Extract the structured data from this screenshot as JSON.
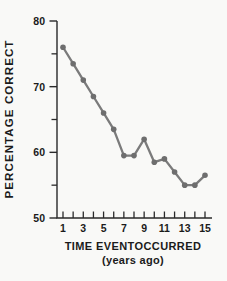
{
  "chart_data": {
    "type": "line",
    "title": "",
    "xlabel": "TIME EVENTOCCURRED",
    "xlabel_sub": "(years ago)",
    "ylabel": "PERCENTAGE CORRECT",
    "x": [
      1,
      2,
      3,
      4,
      5,
      6,
      7,
      8,
      9,
      10,
      11,
      12,
      13,
      14,
      15
    ],
    "values": [
      76,
      73.5,
      71,
      68.5,
      66,
      63.5,
      59.5,
      59.5,
      62,
      58.5,
      59,
      57,
      55,
      55,
      56.5
    ],
    "xlim": [
      1,
      15
    ],
    "ylim": [
      50,
      80
    ],
    "x_minor_ticks": [
      1,
      2,
      3,
      4,
      5,
      6,
      7,
      8,
      9,
      10,
      11,
      12,
      13,
      14,
      15
    ],
    "x_label_ticks": [
      1,
      3,
      5,
      7,
      9,
      11,
      13,
      15
    ],
    "y_major_ticks": [
      50,
      60,
      70,
      80
    ],
    "y_minor_ticks": [
      55,
      65,
      75
    ],
    "grid": false,
    "legend": null,
    "colors": {
      "line": "#7b7b7b",
      "marker": "#6e6e6e",
      "axis": "#2a2a2a",
      "text": "#1b1b1b",
      "background": "#f9f9f7"
    }
  }
}
